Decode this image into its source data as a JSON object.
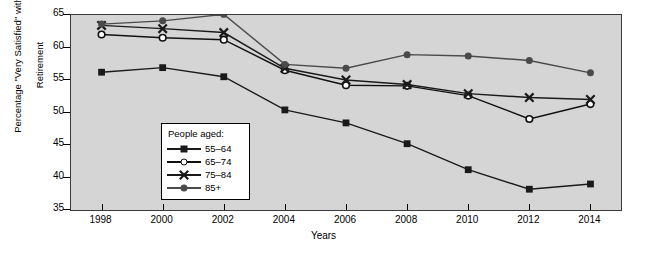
{
  "chart_data": {
    "type": "line",
    "title": "",
    "xlabel": "Years",
    "ylabel": "Percentage \"Very Satisfied\" with Retirement",
    "ylabel_line1": "Percentage \"Very Satisfied\" with",
    "ylabel_line2": "Retirement",
    "categories": [
      1998,
      2000,
      2002,
      2004,
      2006,
      2008,
      2010,
      2012,
      2014
    ],
    "x": [
      "1998",
      "2000",
      "2002",
      "2004",
      "2006",
      "2008",
      "2010",
      "2012",
      "2014"
    ],
    "xlim": [
      1997,
      2015
    ],
    "ylim": [
      35,
      65
    ],
    "yticks": [
      35,
      40,
      45,
      50,
      55,
      60,
      65
    ],
    "ytick_labels": [
      "35",
      "40",
      "45",
      "50",
      "55",
      "60",
      "65"
    ],
    "grid": false,
    "legend_position": "inside-lower-left",
    "legend_title": "People aged:",
    "plot_background": "#d5d5d5",
    "series": [
      {
        "name": "55–64",
        "marker": "filled-square",
        "color": "#1a1a1a",
        "values": [
          56.2,
          56.9,
          55.5,
          50.4,
          48.4,
          45.2,
          41.2,
          38.2,
          39.0
        ]
      },
      {
        "name": "65–74",
        "marker": "open-circle",
        "color": "#111111",
        "values": [
          62.0,
          61.5,
          61.2,
          56.5,
          54.2,
          54.1,
          52.6,
          49.0,
          51.3
        ]
      },
      {
        "name": "75–84",
        "marker": "x-cross",
        "color": "#1a1a1a",
        "values": [
          63.4,
          62.9,
          62.3,
          56.8,
          55.0,
          54.3,
          52.9,
          52.3,
          52.0
        ]
      },
      {
        "name": "85+",
        "marker": "filled-circle",
        "color": "#4a4a4a",
        "values": [
          63.6,
          64.1,
          65.1,
          57.4,
          56.8,
          58.9,
          58.7,
          58.0,
          56.1
        ]
      }
    ]
  }
}
